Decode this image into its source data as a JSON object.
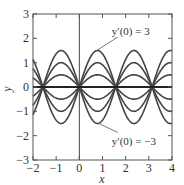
{
  "chart_data": {
    "type": "line",
    "title": "",
    "xlabel": "x",
    "ylabel": "y",
    "xlim": [
      -2,
      4
    ],
    "ylim": [
      -3,
      3
    ],
    "xticks": [
      -2,
      -1,
      0,
      1,
      2,
      3,
      4
    ],
    "yticks": [
      -3,
      -2,
      -1,
      0,
      1,
      2,
      3
    ],
    "xtick_labels": [
      "−2",
      "−1",
      "0",
      "1",
      "2",
      "3",
      "4"
    ],
    "ytick_labels": [
      "−3",
      "−2",
      "−1",
      "0",
      "1",
      "2",
      "3"
    ],
    "grid": false,
    "function": "y = (y'(0)/2) sin(2x)",
    "series": [
      {
        "name": "y'(0) = 3",
        "amplitude": 1.5
      },
      {
        "name": "y'(0) = 2",
        "amplitude": 1.0
      },
      {
        "name": "y'(0) = 1",
        "amplitude": 0.5
      },
      {
        "name": "y'(0) = 0",
        "amplitude": 0.0
      },
      {
        "name": "y'(0) = -1",
        "amplitude": -0.5
      },
      {
        "name": "y'(0) = -2",
        "amplitude": -1.0
      },
      {
        "name": "y'(0) = -3",
        "amplitude": -1.5
      }
    ],
    "annotations": [
      {
        "text": "y′(0) = 3",
        "x": 1.4,
        "y": 2.3,
        "arrow_to": [
          0.75,
          1.5
        ]
      },
      {
        "text": "y′(0) = −3",
        "x": 1.4,
        "y": -2.2,
        "arrow_to": [
          0.85,
          -1.5
        ]
      }
    ]
  }
}
